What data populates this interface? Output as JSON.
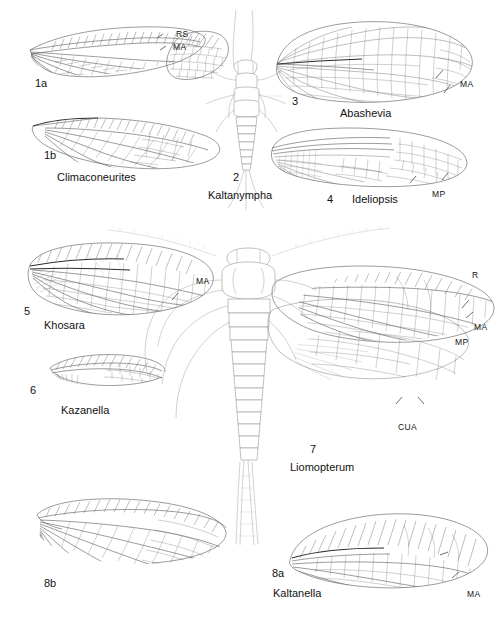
{
  "plate": {
    "title": "Fossil insect wing venation plate",
    "background_color": "#ffffff",
    "ink_color": "#3a3a3a",
    "label_color": "#121212",
    "width": 503,
    "height": 620,
    "footer_caption": ""
  },
  "figures": [
    {
      "id": "1a",
      "number": "1a",
      "genus": "",
      "kind": "forewing-fragment",
      "vein_labels": [
        "RS",
        "MA"
      ]
    },
    {
      "id": "1b",
      "number": "1b",
      "genus": "Climaconeurites",
      "kind": "complete-wing",
      "vein_labels": []
    },
    {
      "id": "2",
      "number": "2",
      "genus": "Kaltanympha",
      "kind": "nymph-body",
      "vein_labels": []
    },
    {
      "id": "3",
      "number": "3",
      "genus": "Abashevia",
      "kind": "complete-wing",
      "vein_labels": [
        "MA"
      ]
    },
    {
      "id": "4",
      "number": "4",
      "genus": "Ideliopsis",
      "kind": "complete-wing",
      "vein_labels": [
        "MP"
      ]
    },
    {
      "id": "5",
      "number": "5",
      "genus": "Khosara",
      "kind": "complete-wing",
      "vein_labels": [
        "MA"
      ]
    },
    {
      "id": "6",
      "number": "6",
      "genus": "Kazanella",
      "kind": "wing-base-fragment",
      "vein_labels": []
    },
    {
      "id": "7",
      "number": "7",
      "genus": "Liomopterum",
      "kind": "whole-insect-body-with-wings",
      "vein_labels": [
        "R",
        "MA",
        "MP",
        "CUA"
      ]
    },
    {
      "id": "8a",
      "number": "8a",
      "genus": "Kaltanella",
      "kind": "complete-wing",
      "vein_labels": [
        "MA"
      ]
    },
    {
      "id": "8b",
      "number": "8b",
      "genus": "",
      "kind": "hindwing",
      "vein_labels": []
    }
  ],
  "vein_label_text": {
    "rs": "RS",
    "ma": "MA",
    "mp": "MP",
    "r": "R",
    "cua": "CUA"
  }
}
